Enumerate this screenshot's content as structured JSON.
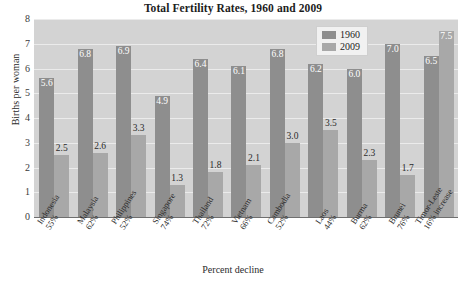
{
  "chart_data": {
    "type": "bar",
    "title": "Total Fertility Rates, 1960 and 2009",
    "xlabel": "Percent decline",
    "ylabel": "Births per woman",
    "ylim": [
      0,
      8
    ],
    "yticks": [
      "8",
      "7",
      "6",
      "5",
      "4",
      "3",
      "2",
      "1",
      "0"
    ],
    "grid": true,
    "legend_position": "top-right",
    "categories": [
      "Indonesia",
      "Malaysia",
      "Philippines",
      "Singapore",
      "Thailand",
      "Vietnam",
      "Cambodia",
      "Laos",
      "Burma",
      "Brunei",
      "Timor-Leste"
    ],
    "category_sublabels": [
      "55%",
      "62%",
      "52%",
      "74%",
      "72%",
      "66%",
      "52%",
      "44%",
      "62%",
      "76%",
      "16% increase"
    ],
    "series": [
      {
        "name": "1960",
        "color": "#8e8e8e",
        "values": [
          5.6,
          6.8,
          6.9,
          4.9,
          6.4,
          6.1,
          6.8,
          6.2,
          6.0,
          7.0,
          6.5
        ]
      },
      {
        "name": "2009",
        "color": "#a8a8a8",
        "values": [
          2.5,
          2.6,
          3.3,
          1.3,
          1.8,
          2.1,
          3.0,
          3.5,
          2.3,
          1.7,
          7.5
        ]
      }
    ],
    "value_labels": {
      "1960": [
        "5.6",
        "6.8",
        "6.9",
        "4.9",
        "6.4",
        "6.1",
        "6.8",
        "6.2",
        "6.0",
        "7.0",
        "6.5"
      ],
      "2009": [
        "2.5",
        "2.6",
        "3.3",
        "1.3",
        "1.8",
        "2.1",
        "3.0",
        "3.5",
        "2.3",
        "1.7",
        "7.5"
      ]
    }
  },
  "legend": {
    "items": [
      {
        "label": "1960"
      },
      {
        "label": "2009"
      }
    ]
  }
}
